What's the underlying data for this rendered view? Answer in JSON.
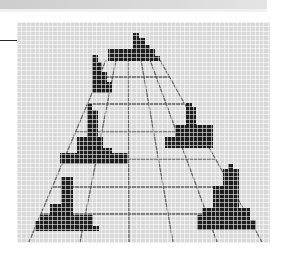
{
  "colors": {
    "panel_background": "#d9d9d9",
    "floor_line": "#666666",
    "block_fill": "#1e1e1e",
    "top_bar": "#d6d6d6",
    "left_rule": "#2a2a2a"
  },
  "floor": {
    "radial_lines": [
      {
        "x1": 106,
        "y1": 60,
        "x2": 29,
        "y2": 242
      },
      {
        "x1": 116,
        "y1": 60,
        "x2": 80,
        "y2": 242
      },
      {
        "x1": 128,
        "y1": 58,
        "x2": 129,
        "y2": 242
      },
      {
        "x1": 141,
        "y1": 60,
        "x2": 173,
        "y2": 242
      },
      {
        "x1": 150,
        "y1": 60,
        "x2": 217,
        "y2": 242
      },
      {
        "x1": 160,
        "y1": 60,
        "x2": 262,
        "y2": 242
      }
    ],
    "cross_lines": [
      {
        "y": 77,
        "x1": 99,
        "x2": 169
      },
      {
        "y": 104,
        "x1": 87,
        "x2": 185
      },
      {
        "y": 132,
        "x1": 75,
        "x2": 200
      },
      {
        "y": 159,
        "x1": 64,
        "x2": 215
      },
      {
        "y": 187,
        "x1": 52,
        "x2": 231
      },
      {
        "y": 214,
        "x1": 41,
        "x2": 246
      }
    ]
  },
  "pixel_shapes": [
    {
      "name": "shape-top-center",
      "rects": [
        [
          133,
          33,
          6,
          5
        ],
        [
          133,
          38,
          12,
          7
        ],
        [
          133,
          45,
          17,
          4
        ],
        [
          108,
          49,
          47,
          7
        ],
        [
          108,
          56,
          52,
          5
        ]
      ]
    },
    {
      "name": "shape-upper-left",
      "rects": [
        [
          92,
          55,
          6,
          7
        ],
        [
          92,
          62,
          10,
          10
        ],
        [
          92,
          72,
          15,
          10
        ],
        [
          92,
          82,
          20,
          11
        ]
      ]
    },
    {
      "name": "shape-middle-left",
      "rects": [
        [
          87,
          104,
          5,
          6
        ],
        [
          87,
          110,
          11,
          27
        ],
        [
          77,
          137,
          26,
          11
        ],
        [
          77,
          148,
          35,
          5
        ],
        [
          60,
          153,
          68,
          11
        ]
      ]
    },
    {
      "name": "shape-middle-right",
      "rects": [
        [
          186,
          103,
          6,
          4
        ],
        [
          186,
          107,
          10,
          18
        ],
        [
          175,
          125,
          38,
          12
        ],
        [
          165,
          137,
          48,
          11
        ]
      ]
    },
    {
      "name": "shape-lower-right",
      "rects": [
        [
          228,
          164,
          5,
          5
        ],
        [
          223,
          169,
          16,
          17
        ],
        [
          213,
          186,
          26,
          22
        ],
        [
          202,
          208,
          48,
          7
        ],
        [
          197,
          215,
          53,
          5
        ],
        [
          197,
          220,
          59,
          10
        ]
      ]
    },
    {
      "name": "shape-lower-left",
      "rects": [
        [
          61,
          177,
          12,
          27
        ],
        [
          50,
          204,
          23,
          11
        ],
        [
          40,
          215,
          53,
          6
        ],
        [
          35,
          221,
          58,
          5
        ],
        [
          35,
          226,
          64,
          5
        ]
      ]
    }
  ]
}
